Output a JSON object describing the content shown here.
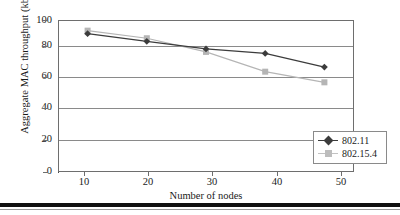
{
  "chart_data": {
    "type": "line",
    "title": "",
    "xlabel": "Number of nodes",
    "ylabel": "Aggregate MAC throughput (kbps)",
    "x": [
      10,
      20,
      30,
      40,
      50
    ],
    "xtick_labels": [
      "10",
      "20",
      "30",
      "40",
      "50"
    ],
    "ytick_labels": [
      "0",
      "20",
      "40",
      "60",
      "80",
      "100"
    ],
    "yticks": [
      0,
      20,
      40,
      60,
      80,
      100
    ],
    "ylim": [
      0,
      100
    ],
    "xlim": [
      5,
      55
    ],
    "grid": "horizontal",
    "legend_position": "bottom-right",
    "series": [
      {
        "name": "802.11",
        "values": [
          91,
          86,
          81,
          78,
          69
        ],
        "color": "#3c3c3c",
        "marker": "diamond"
      },
      {
        "name": "802.15.4",
        "values": [
          93,
          88,
          79,
          66,
          59
        ],
        "color": "#b5b5b5",
        "marker": "square"
      }
    ]
  },
  "legend": {
    "items": [
      {
        "label": "802.11"
      },
      {
        "label": "802.15.4"
      }
    ]
  },
  "colors": {
    "series_1": "#3c3c3c",
    "series_2": "#b5b5b5",
    "grid": "#8a8a8a",
    "axis": "#4a4a4a",
    "text": "#1a1a1a",
    "rule": "#111111"
  }
}
